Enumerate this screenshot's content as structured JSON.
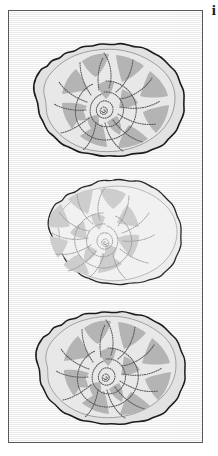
{
  "figure": {
    "panel_label": "i",
    "caption_text": "",
    "specimen_count": 3
  },
  "colors": {
    "panel_background": "#ffffff",
    "plate_background": "#f4f4f4",
    "plate_border": "#58585c",
    "shell_outline_dark": "#1c1c1c",
    "shell_outline_mid": "#6e6e6e",
    "shell_outline_faint": "#8c8c90",
    "body_fill_light": "#e2e2e2",
    "body_fill_light_faint": "#ededed",
    "chamber_fill_grey": "#b4b4b4",
    "chamber_fill_grey_faint": "#cdcdcd",
    "suture_line_dark": "#5a5a5a",
    "suture_line_faint": "#9a9a9e",
    "label_text": "#191919"
  },
  "specimens": [
    {
      "id": "specimen-top",
      "name": "ammonite-cross-section-1",
      "label": "",
      "coiling": "left-of-center spiral, counter-clockwise",
      "tone": "dark",
      "whorl_count": 3,
      "chamber_count": 13,
      "position": {
        "x": 14,
        "y": 22,
        "width": 170,
        "height": 130
      }
    },
    {
      "id": "specimen-middle",
      "name": "ammonite-cross-section-2",
      "label": "",
      "coiling": "right-of-center spiral, clockwise",
      "tone": "faint",
      "whorl_count": 3,
      "chamber_count": 12,
      "position": {
        "x": 30,
        "y": 158,
        "width": 148,
        "height": 125
      }
    },
    {
      "id": "specimen-bottom",
      "name": "ammonite-cross-section-3",
      "label": "",
      "coiling": "left-of-center spiral, counter-clockwise",
      "tone": "dark",
      "whorl_count": 3,
      "chamber_count": 13,
      "position": {
        "x": 16,
        "y": 292,
        "width": 166,
        "height": 124
      }
    }
  ]
}
